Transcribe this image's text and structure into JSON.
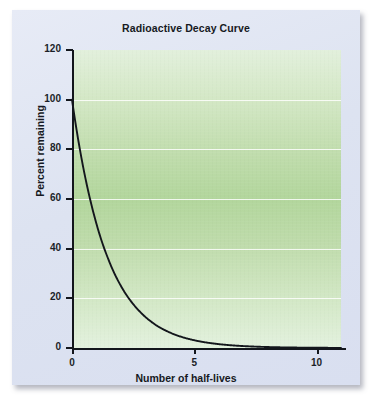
{
  "figure": {
    "title": "Radioactive Decay Curve",
    "panel_color": "#dfe5f2",
    "plot_fill_light": "#e2f0dc",
    "plot_fill_mid": "#b2d69c",
    "curve_color": "#13161c",
    "gridline_color": "#ffffff"
  },
  "chart_data": {
    "type": "line",
    "title": "Radioactive Decay Curve",
    "xlabel": "Number of half-lives",
    "ylabel": "Percent remaining",
    "xlim": [
      0,
      11
    ],
    "ylim": [
      0,
      120
    ],
    "grid": true,
    "legend": "none",
    "x_ticks": [
      0,
      5,
      10
    ],
    "x_tick_labels": [
      "0",
      "5",
      "10"
    ],
    "y_ticks": [
      0,
      20,
      40,
      60,
      80,
      100,
      120
    ],
    "y_tick_labels": [
      "0",
      "20",
      "40",
      "60",
      "80",
      "100",
      "120"
    ],
    "gridlines_at": [
      20,
      40,
      60,
      80,
      100
    ],
    "series": [
      {
        "name": "Percent remaining",
        "x": [
          0,
          0.25,
          0.5,
          0.75,
          1,
          1.25,
          1.5,
          1.75,
          2,
          2.25,
          2.5,
          2.75,
          3,
          3.5,
          4,
          4.5,
          5,
          5.5,
          6,
          6.5,
          7,
          7.5,
          8,
          9,
          10,
          11
        ],
        "values": [
          100,
          84.1,
          70.7,
          59.5,
          50,
          42.0,
          35.4,
          29.7,
          25,
          21.0,
          17.7,
          14.9,
          12.5,
          8.8,
          6.25,
          4.4,
          3.125,
          2.2,
          1.56,
          1.1,
          0.78,
          0.55,
          0.39,
          0.195,
          0.098,
          0.049
        ]
      }
    ],
    "annotations": []
  },
  "axes": {
    "y_title": "Percent remaining",
    "x_title": "Number of half-lives",
    "y_labels": [
      "120",
      "100",
      "80",
      "60",
      "40",
      "20",
      "0"
    ],
    "x_labels": [
      "0",
      "5",
      "10"
    ]
  }
}
